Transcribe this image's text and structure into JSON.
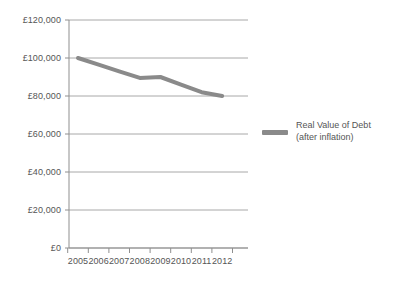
{
  "chart_data": {
    "type": "line",
    "title": "",
    "subtitle": "",
    "xlabel": "",
    "ylabel": "",
    "x": [
      "2005",
      "2006",
      "2007",
      "2008",
      "2009",
      "2010",
      "2011",
      "2012"
    ],
    "categories": [
      "2005",
      "2006",
      "2007",
      "2008",
      "2009",
      "2010",
      "2011",
      "2012"
    ],
    "series": [
      {
        "name": "Real Value of Debt (after inflation)",
        "color": "#8a8a8a",
        "values": [
          100000,
          96500,
          93000,
          89500,
          90000,
          86000,
          82000,
          80000
        ]
      }
    ],
    "ylim": [
      0,
      120000
    ],
    "ytick_values": [
      0,
      20000,
      40000,
      60000,
      80000,
      100000,
      120000
    ],
    "ytick_labels": [
      "£0",
      "£20,000",
      "£40,000",
      "£60,000",
      "£80,000",
      "£100,000",
      "£120,000"
    ],
    "xtick_labels": [
      "2005",
      "2006",
      "2007",
      "2008",
      "2009",
      "2010",
      "2011",
      "2012"
    ],
    "grid": "horizontal",
    "legend_position": "right",
    "currency_symbol": "£"
  },
  "legend": {
    "entries": [
      {
        "line1": "Real Value of Debt",
        "line2": "(after inflation)",
        "color": "#8a8a8a"
      }
    ]
  },
  "colors": {
    "series": "#8a8a8a",
    "gridline": "#a8a8a8",
    "axis": "#8f8f8f",
    "text": "#555555",
    "background": "#ffffff"
  },
  "geometry": {
    "plot_left": 69,
    "plot_right": 248,
    "plot_top": 20,
    "plot_bottom": 248,
    "x_first": 78,
    "x_step": 20.6
  }
}
